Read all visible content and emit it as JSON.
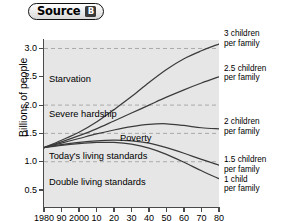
{
  "source": {
    "word": "Source",
    "letter": "B"
  },
  "chart_data": {
    "type": "line",
    "title": "",
    "xlabel": "",
    "ylabel": "Billions of people",
    "xlim": [
      1980,
      2080
    ],
    "ylim": [
      0.2,
      3.15
    ],
    "grid": true,
    "grid_style": "dashed-horizontal",
    "legend_position": "right-of-plot",
    "x_ticks": [
      "1980",
      "90",
      "2000",
      "10",
      "20",
      "30",
      "40",
      "50",
      "60",
      "70",
      "80"
    ],
    "x_tick_values": [
      1980,
      1990,
      2000,
      2010,
      2020,
      2030,
      2040,
      2050,
      2060,
      2070,
      2080
    ],
    "y_ticks": [
      "0.5",
      "1.0",
      "1.5",
      "2.0",
      "2.5",
      "3.0"
    ],
    "y_tick_values": [
      0.5,
      1.0,
      1.5,
      2.0,
      2.5,
      3.0
    ],
    "x": [
      1980,
      1990,
      2000,
      2010,
      2020,
      2030,
      2040,
      2050,
      2060,
      2070,
      2080
    ],
    "series": [
      {
        "name": "3 children per family",
        "label_line1": "3 children",
        "label_line2": "per family",
        "values": [
          1.25,
          1.38,
          1.52,
          1.7,
          1.92,
          2.15,
          2.4,
          2.63,
          2.82,
          2.96,
          3.08
        ]
      },
      {
        "name": "2.5 children per family",
        "label_line1": "2.5 children",
        "label_line2": "per family",
        "values": [
          1.25,
          1.35,
          1.46,
          1.58,
          1.72,
          1.86,
          2.0,
          2.14,
          2.27,
          2.39,
          2.5
        ]
      },
      {
        "name": "2 children per family",
        "label_line1": "2 children",
        "label_line2": "per family",
        "values": [
          1.25,
          1.33,
          1.41,
          1.49,
          1.56,
          1.62,
          1.66,
          1.67,
          1.64,
          1.6,
          1.58
        ]
      },
      {
        "name": "1.5 children per family",
        "label_line1": "1.5 children",
        "label_line2": "per family",
        "values": [
          1.25,
          1.3,
          1.34,
          1.37,
          1.38,
          1.37,
          1.33,
          1.25,
          1.15,
          1.04,
          0.94
        ]
      },
      {
        "name": "1 child per family",
        "label_line1": "1 child",
        "label_line2": "per family",
        "values": [
          1.25,
          1.29,
          1.32,
          1.34,
          1.34,
          1.31,
          1.24,
          1.13,
          0.99,
          0.84,
          0.7
        ]
      }
    ],
    "band_labels": [
      {
        "text": "Starvation",
        "y_value": 2.45
      },
      {
        "text": "Severe hardship",
        "y_value": 1.83
      },
      {
        "text": "Poverty",
        "y_value": 1.4
      },
      {
        "text": "Today's living standards",
        "y_value": 1.08
      },
      {
        "text": "Double living standards",
        "y_value": 0.62
      }
    ],
    "gridlines_y": [
      1.0,
      1.5,
      2.0,
      3.0
    ],
    "colors": {
      "plot_background": "#e6e6e6",
      "line": "#3b3b3b",
      "axis": "#4a4a4a",
      "grid": "#9a9a9a",
      "text": "#000000",
      "badge": "#3a3a3a"
    }
  }
}
